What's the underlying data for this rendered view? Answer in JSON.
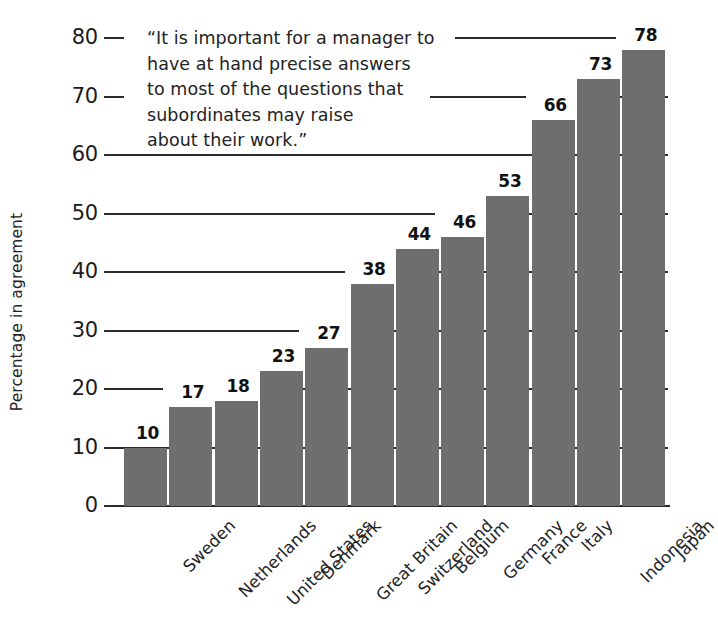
{
  "chart_data": {
    "type": "bar",
    "title": "",
    "subtitle": "",
    "annotation": "“It is important for a manager to have at hand precise answers to most of the questions that subordinates may raise about their work.”",
    "annotation_lines": [
      "“It is important for a manager to",
      "have at hand precise answers",
      "to most of the questions that",
      "subordinates may raise",
      "about their work.”"
    ],
    "categories": [
      "Sweden",
      "Netherlands",
      "United States",
      "Denmark",
      "Great Britain",
      "Switzerland",
      "Belgium",
      "Germany",
      "France",
      "Italy",
      "Indonesia",
      "Japan"
    ],
    "values": [
      10,
      17,
      18,
      23,
      27,
      38,
      44,
      46,
      53,
      66,
      73,
      78
    ],
    "value_labels": [
      "10",
      "17",
      "18",
      "23",
      "27",
      "38",
      "44",
      "46",
      "53",
      "66",
      "73",
      "78"
    ],
    "xlabel": "",
    "ylabel": "Percentage in agreement",
    "ylim": [
      0,
      80
    ],
    "ytick_values": [
      0,
      10,
      20,
      30,
      40,
      50,
      60,
      70,
      80
    ],
    "ytick_labels": [
      "0",
      "10",
      "20",
      "30",
      "40",
      "50",
      "60",
      "70",
      "80"
    ],
    "grid": true,
    "legend": false,
    "bar_color": "#6e6e6e",
    "axis_color": "#2b2b2b",
    "background_color": "#ffffff"
  }
}
